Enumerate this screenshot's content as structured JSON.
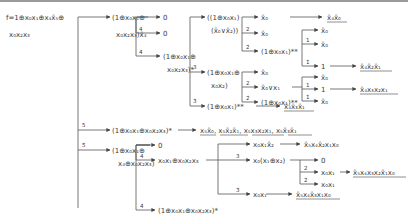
{
  "root": {
    "line1": "f=1⊕x₀x₁⊕x₄x̄₅⊕",
    "line2": "x₀x₂x₃"
  },
  "nodes": {
    "a": {
      "line1": "(1⊕x₀x₁⊕",
      "line2": "x₀x₂x₃)x̄₄"
    },
    "a_0a": "0",
    "a_0b": "0",
    "b": {
      "line1": "(1⊕x₀x₁⊕",
      "line2": "x₀x₂x₃)*"
    },
    "c": {
      "line1": "((1⊕x₀x₁)",
      "line2": "(x̄₀∨x̄₂))"
    },
    "c1": "x̄₀",
    "c2": "x̄₀",
    "c3": "(1⊕x₀x₁)**",
    "c3a": "x̄₀",
    "c3b": "x̄₀",
    "c3c": "1",
    "d": {
      "line1": "(1⊕x₀x₁⊕",
      "line2": "x₀x₂)"
    },
    "d1": "x̄₀",
    "d2": "x̄₀∨x₁",
    "d2a": "x̄₀",
    "d2b": "1",
    "d2c": "x̄₀",
    "d3": "(1⊕x₀x₁)**",
    "e": "(1⊕x₀x₁)**",
    "f": "(1⊕x₀x₁⊕x₀x₂x₃)*",
    "g": {
      "line1": "(1⊕x₀x₁⊕",
      "line2": "x₄⊕x₀x₂x₃)"
    },
    "g1": "0",
    "g2": "x₀x₁⊕x₀x₂x₃",
    "g2a": "x₀x₁x̄₂",
    "g2b": "x₀(x₁⊕x₂)",
    "g2b1": "0",
    "g2b2": "x₀x₁",
    "g2b3": "x₀x₁",
    "g2c": "x₀x₁",
    "g3": "(1⊕x₀x₁⊕x₀x₂x₃)*"
  },
  "results": {
    "c1": "x̄₄x̄₀",
    "c3c": "x̄₄x̄₂x̄₁",
    "d2b": "x̄₄x₃x₂x₁",
    "e": "x̄₄x̄₃x̄₁",
    "f": "x₅x̄₀, x₅x̄₂x̄₁, x₅x₃x₂x₁, x₅x̄₃x̄₁",
    "g2a": "x̄₅x₄x̄₂x₁x₀",
    "g2b2": "x̄₅x₄x₃x₂x̄₁x₀",
    "g2c": "x̄₅x₄x̄₃x₁x₀"
  },
  "edge_labels": {
    "a_0b": "4",
    "b": "4̄",
    "d": "3",
    "e": "3̄",
    "c2": "2",
    "c3": "2̄",
    "c3b": "1",
    "c3c": "1̄",
    "d2": "2",
    "d3": "2̄",
    "d2b": "1",
    "d2c": "1̄",
    "f": "5",
    "g": "5̄",
    "g2": "4",
    "g3": "4̄",
    "g2b": "3",
    "g2c": "3̄",
    "g2b2": "2",
    "g2b3": "2̄"
  }
}
